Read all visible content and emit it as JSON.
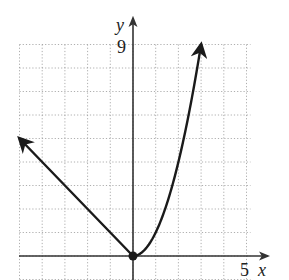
{
  "chart_data": {
    "type": "line",
    "title": "",
    "xlabel": "x",
    "ylabel": "y",
    "xlim": [
      -5,
      5
    ],
    "ylim": [
      -1,
      9
    ],
    "grid": true,
    "grid_style": "dotted",
    "tick_labels": {
      "x": [
        "5"
      ],
      "y": [
        "9"
      ]
    },
    "series": [
      {
        "name": "left branch",
        "equation": "y = -x, x <= 0",
        "x": [
          -5,
          -4,
          -3,
          -2,
          -1,
          0
        ],
        "y": [
          5,
          4,
          3,
          2,
          1,
          0
        ],
        "arrow_end": "left"
      },
      {
        "name": "right branch",
        "equation": "y = x^2, x >= 0",
        "x": [
          0,
          0.5,
          1,
          1.5,
          2,
          2.5,
          3
        ],
        "y": [
          0,
          0.25,
          1,
          2.25,
          4,
          6.25,
          9
        ],
        "arrow_end": "right"
      }
    ],
    "points": [
      {
        "x": 0,
        "y": 0,
        "style": "filled"
      }
    ]
  },
  "labels": {
    "x_axis": "x",
    "y_axis": "y",
    "x_tick": "5",
    "y_tick": "9"
  },
  "colors": {
    "curve": "#1a1a1a",
    "axis": "#333333",
    "grid": "#999999"
  }
}
